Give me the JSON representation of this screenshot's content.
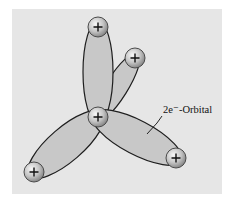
{
  "diagram": {
    "label": "2e⁻-Orbital",
    "nucleus_symbol": "+",
    "colors": {
      "panel": "#e6e6e6",
      "orbital_fill": "#c8c8c8",
      "orbital_stroke": "#1e1e1e",
      "nucleus_light": "#f4f4f4",
      "nucleus_dark": "#8a8a8a"
    },
    "nuclei": [
      {
        "id": "central",
        "symbol": "+"
      },
      {
        "id": "top",
        "symbol": "+"
      },
      {
        "id": "upper-right",
        "symbol": "+"
      },
      {
        "id": "bottom-left",
        "symbol": "+"
      },
      {
        "id": "bottom-right",
        "symbol": "+"
      }
    ],
    "orbitals": [
      {
        "id": "orbital-top",
        "connects": [
          "central",
          "top"
        ]
      },
      {
        "id": "orbital-upper-right",
        "connects": [
          "central",
          "upper-right"
        ]
      },
      {
        "id": "orbital-bottom-left",
        "connects": [
          "central",
          "bottom-left"
        ]
      },
      {
        "id": "orbital-bottom-right",
        "connects": [
          "central",
          "bottom-right"
        ]
      }
    ]
  }
}
